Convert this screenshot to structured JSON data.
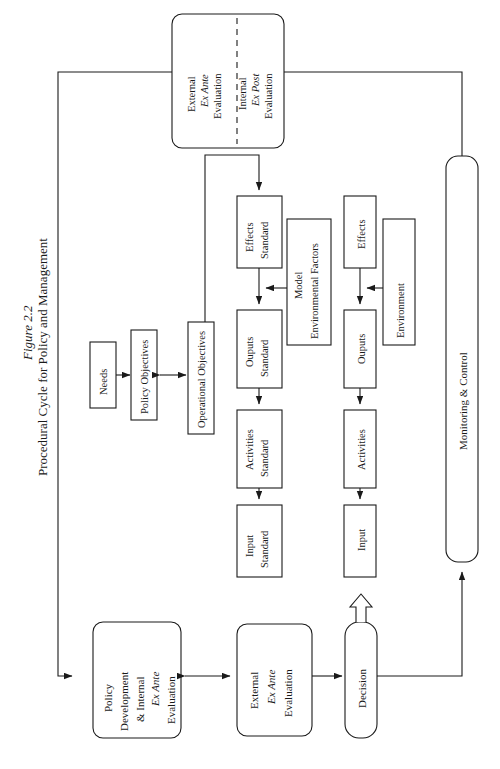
{
  "figure": {
    "number": "Figure 2.2",
    "caption": "Procedural Cycle for Policy and Management"
  },
  "diagram": {
    "type": "flowchart",
    "orientation": "rotated-90-ccw",
    "nodes": {
      "evaluation_external": "External",
      "evaluation_external_em": "Ex Ante",
      "evaluation_external_tail": "Evaluation",
      "evaluation_internal": "Internal",
      "evaluation_internal_em": "Ex Post",
      "evaluation_internal_tail": "Evaluation",
      "needs": "Needs",
      "policy_objectives": "Policy Objectives",
      "operational_objectives": "Operational Objectives",
      "effects_standard_l1": "Effects",
      "effects_standard_l2": "Standard",
      "outputs_standard_l1": "Ouputs",
      "outputs_standard_l2": "Standard",
      "activities_standard_l1": "Activities",
      "activities_standard_l2": "Standard",
      "input_standard_l1": "Input",
      "input_standard_l2": "Standard",
      "model_env_l1": "Model",
      "model_env_l2": "Environmental Factors",
      "effects": "Effects",
      "outputs": "Ouputs",
      "activities": "Activities",
      "input": "Input",
      "environment": "Environment",
      "monitoring_control": "Monitoring  &  Control",
      "policy_dev_l1": "Policy",
      "policy_dev_l2": "Development",
      "policy_dev_l3": "& Internal",
      "policy_dev_em": "Ex Ante",
      "policy_dev_l5": "Evaluation",
      "ext_eval_l1": "External",
      "ext_eval_em": "Ex Ante",
      "ext_eval_l3": "Evaluation",
      "decision": "Decision"
    },
    "colors": {
      "stroke": "#1a1a1a",
      "fill": "#ffffff",
      "background": "#ffffff"
    }
  }
}
